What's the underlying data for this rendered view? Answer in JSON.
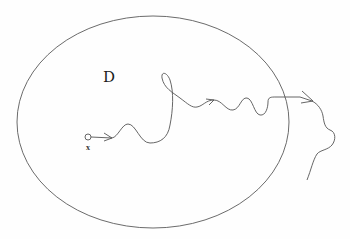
{
  "diagram": {
    "type": "brownian-path-exit-domain",
    "domain_label": "D",
    "start_point_label": "x",
    "colors": {
      "stroke": "#555555",
      "background": "#fefefe",
      "text": "#1a1a1a"
    },
    "domain": {
      "shape": "ellipse",
      "cx": 153,
      "cy": 122,
      "rx": 136,
      "ry": 106
    },
    "start_point": {
      "x": 88,
      "y": 137,
      "r": 3
    },
    "path_description": "Random path starting at x, wandering inside D with direction arrows, crossing the boundary on the right and continuing outside."
  }
}
